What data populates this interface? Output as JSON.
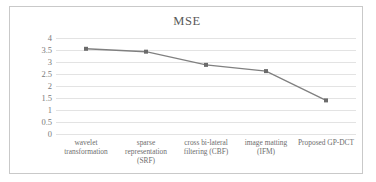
{
  "chart_data": {
    "type": "line",
    "title": "MSE",
    "xlabel": "",
    "ylabel": "",
    "categories": [
      "wavelet transformation",
      "sparse representation (SRF)",
      "cross bi-lateral filtering (CBF)",
      "image matting (IFM)",
      "Proposed GP-DCT"
    ],
    "category_lines": [
      [
        "wavelet",
        "transformation"
      ],
      [
        "sparse",
        "representation",
        "(SRF)"
      ],
      [
        "cross bi-lateral",
        "filtering (CBF)"
      ],
      [
        "image matting",
        "(IFM)"
      ],
      [
        "Proposed GP-DCT"
      ]
    ],
    "series": [
      {
        "name": "MSE",
        "values": [
          3.55,
          3.43,
          2.88,
          2.62,
          1.4
        ]
      }
    ],
    "ylim": [
      0,
      4
    ],
    "yticks": [
      "4",
      "3.5",
      "3",
      "2.5",
      "2",
      "1.5",
      "1",
      "0.5",
      "0"
    ],
    "ytick_values": [
      4,
      3.5,
      3,
      2.5,
      2,
      1.5,
      1,
      0.5,
      0
    ],
    "grid": true,
    "legend": "none",
    "line_color": "#808080",
    "marker_color": "#6b6b6b",
    "grid_color": "#e3e3e3",
    "title_color": "#595959"
  }
}
